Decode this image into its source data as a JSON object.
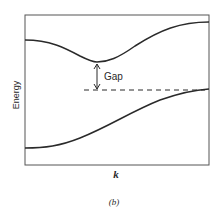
{
  "figure": {
    "panel_label": "(b)",
    "ylabel": "Energy",
    "xlabel": "k",
    "annotation": "Gap"
  },
  "colors": {
    "line": "#2a2a2a",
    "frame": "#555555",
    "background": "#ffffff"
  },
  "diagram": {
    "type": "band-structure",
    "elements": [
      {
        "name": "upper-band",
        "description": "Upper energy band curve with a minimum near the center-left"
      },
      {
        "name": "lower-band",
        "description": "Lower energy band curve rising to a maximum at the right edge"
      },
      {
        "name": "gap-arrow",
        "description": "Double-headed vertical arrow between upper band minimum and dashed level"
      },
      {
        "name": "valence-max-line",
        "description": "Horizontal dashed line at the lower band maximum"
      }
    ]
  }
}
